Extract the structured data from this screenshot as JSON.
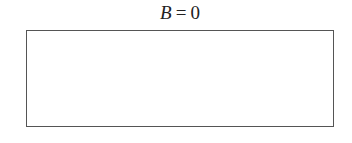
{
  "diagram": {
    "label": {
      "variable": "B",
      "operator": "=",
      "value": "0"
    },
    "box": {
      "border_color": "#555555",
      "fill_color": "#ffffff"
    }
  }
}
